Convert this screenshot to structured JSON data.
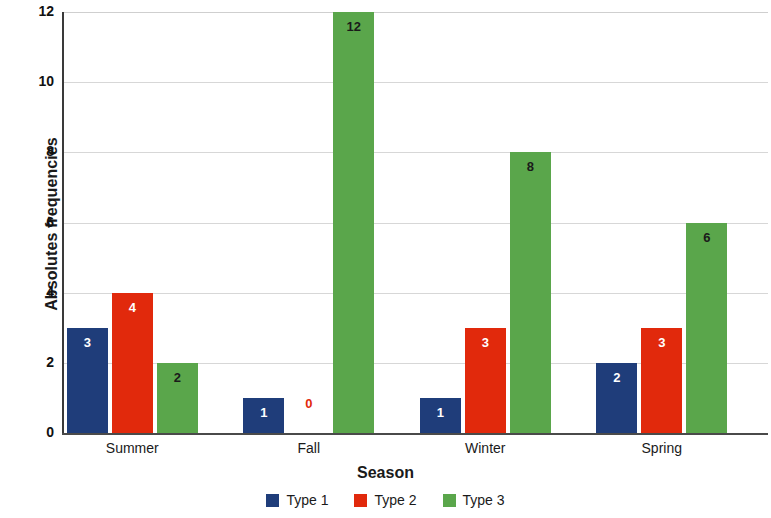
{
  "chart_data": {
    "type": "bar",
    "title": "",
    "xlabel": "Season",
    "ylabel": "Absolutes frequencies",
    "categories": [
      "Summer",
      "Fall",
      "Winter",
      "Spring"
    ],
    "series": [
      {
        "name": "Type 1",
        "color": "#1f3d7a",
        "values": [
          3,
          1,
          1,
          2
        ]
      },
      {
        "name": "Type 2",
        "color": "#e1290c",
        "values": [
          4,
          0,
          3,
          3
        ]
      },
      {
        "name": "Type 3",
        "color": "#5aa64b",
        "values": [
          2,
          12,
          8,
          6
        ]
      }
    ],
    "ylim": [
      0,
      12
    ],
    "yticks": [
      0,
      2,
      4,
      6,
      8,
      10,
      12
    ],
    "ytick_labels": [
      "0",
      "2",
      "4",
      "6",
      "8",
      "10",
      "12"
    ],
    "grid": true,
    "grid_axis": "y",
    "legend_position": "bottom",
    "data_labels": true,
    "bar_value_labels": [
      [
        "3",
        "4",
        "2"
      ],
      [
        "1",
        "0",
        "12"
      ],
      [
        "1",
        "3",
        "8"
      ],
      [
        "2",
        "3",
        "6"
      ]
    ]
  },
  "legend": {
    "items": [
      {
        "label": "Type 1",
        "color": "#1f3d7a"
      },
      {
        "label": "Type 2",
        "color": "#e1290c"
      },
      {
        "label": "Type 3",
        "color": "#5aa64b"
      }
    ]
  }
}
